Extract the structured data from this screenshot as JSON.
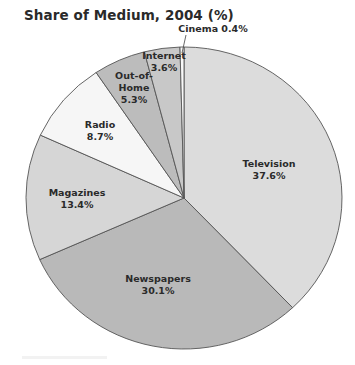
{
  "chart_data": {
    "type": "pie",
    "title": "Share of Medium, 2004 (%)",
    "start_angle_deg": 0,
    "direction": "clockwise",
    "slices": [
      {
        "label": "Television",
        "value": 37.6,
        "display": "37.6%",
        "color": "#dcdcdc",
        "label_lines": [
          "Television"
        ],
        "label_pos": [
          269,
          167
        ]
      },
      {
        "label": "Newspapers",
        "value": 30.1,
        "display": "30.1%",
        "color": "#b9b9b9",
        "label_lines": [
          "Newspapers"
        ],
        "label_pos": [
          158,
          282
        ]
      },
      {
        "label": "Magazines",
        "value": 13.4,
        "display": "13.4%",
        "color": "#d6d6d6",
        "label_lines": [
          "Magazines"
        ],
        "label_pos": [
          77,
          196
        ]
      },
      {
        "label": "Radio",
        "value": 8.7,
        "display": "8.7%",
        "color": "#f6f6f6",
        "label_lines": [
          "Radio"
        ],
        "label_pos": [
          100,
          128
        ]
      },
      {
        "label": "Out-of-Home",
        "value": 5.3,
        "display": "5.3%",
        "color": "#bcbcbc",
        "label_lines": [
          "Out-of-",
          "Home"
        ],
        "label_pos": [
          134,
          79
        ]
      },
      {
        "label": "Internet",
        "value": 3.6,
        "display": "3.6%",
        "color": "#c8c8c8",
        "label_lines": [
          "Internet"
        ],
        "label_pos": [
          164,
          59
        ]
      },
      {
        "label": "Cinema",
        "value": 0.4,
        "display": "0.4%",
        "color": "#f8f8f8",
        "label_lines": [
          "Cinema 0.4%"
        ],
        "label_pos": [
          213,
          32
        ],
        "callout": true
      }
    ],
    "grid": false,
    "legend": "none"
  },
  "footer_note": ""
}
